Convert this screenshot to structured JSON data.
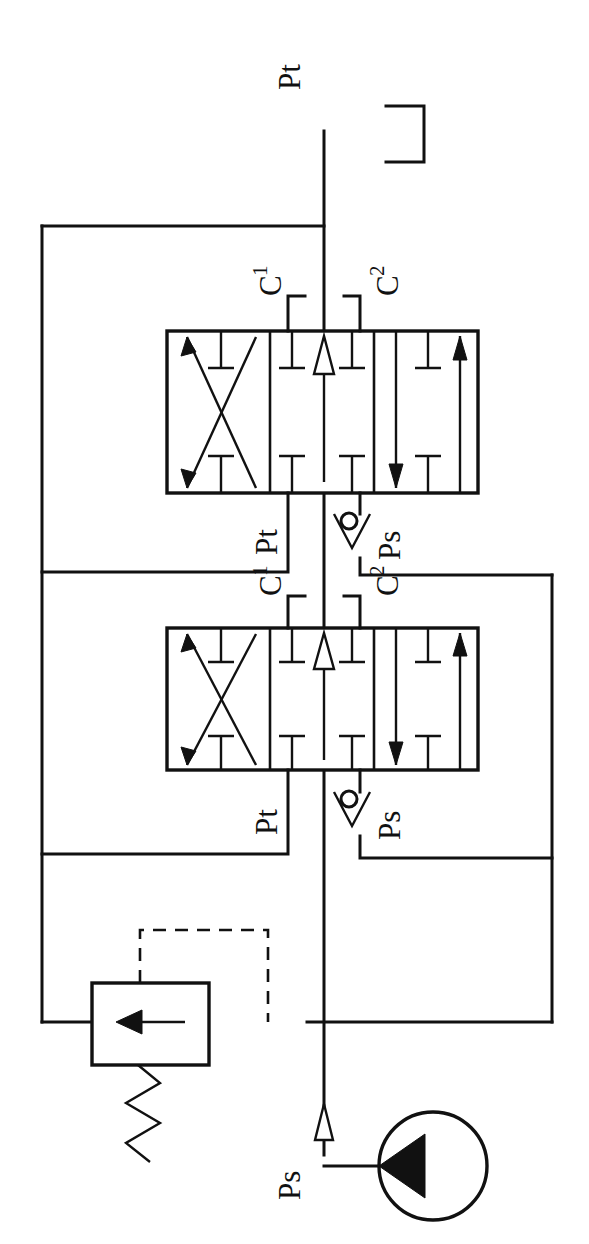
{
  "diagram": {
    "orientation": "rotated-90-ccw",
    "line_color": "#111111",
    "background_color": "#ffffff"
  },
  "labels": {
    "tank_return_top": "Pt",
    "valve1_port_c1": "C",
    "valve1_port_c1_sub": "1",
    "valve1_port_c2": "C",
    "valve1_port_c2_sub": "2",
    "valve1_port_pt": "Pt",
    "valve1_port_ps": "Ps",
    "valve2_port_c1": "C",
    "valve2_port_c1_sub": "1",
    "valve2_port_c2": "C",
    "valve2_port_c2_sub": "2",
    "valve2_port_pt": "Pt",
    "valve2_port_ps": "Ps",
    "pump_supply": "Ps"
  },
  "components": [
    {
      "name": "reservoir-tank",
      "type": "tank",
      "label": "Pt",
      "description": "Open reservoir / tank return symbol"
    },
    {
      "name": "directional-valve-1",
      "type": "directional-control-valve",
      "positions": 3,
      "ports": [
        "C1",
        "C2",
        "Pt",
        "Ps"
      ],
      "center_condition": "all-ports-blocked",
      "description": "4/3-way directional control valve, upper"
    },
    {
      "name": "check-valve-1",
      "type": "ball-check-valve",
      "description": "Ball check valve on supply branch to valve 1"
    },
    {
      "name": "directional-valve-2",
      "type": "directional-control-valve",
      "positions": 3,
      "ports": [
        "C1",
        "C2",
        "Pt",
        "Ps"
      ],
      "center_condition": "all-ports-blocked",
      "description": "4/3-way directional control valve, lower"
    },
    {
      "name": "check-valve-2",
      "type": "ball-check-valve",
      "description": "Ball check valve on supply branch to valve 2"
    },
    {
      "name": "pressure-relief-valve",
      "type": "pressure-relief-valve",
      "features": [
        "spring-return",
        "pilot-line-dashed",
        "flow-arrow"
      ],
      "description": "Spring loaded pressure relief valve with remote pilot line"
    },
    {
      "name": "hydraulic-pump",
      "type": "fixed-displacement-pump",
      "label": "Ps",
      "description": "Fixed displacement pump, unidirectional"
    }
  ],
  "lines": [
    {
      "name": "supply-line-main",
      "label": "Ps",
      "flow": "up"
    },
    {
      "name": "tank-return-manifold",
      "label": "Pt"
    },
    {
      "name": "pressure-manifold-right",
      "label": "Ps"
    },
    {
      "name": "pilot-line",
      "style": "dashed"
    }
  ]
}
